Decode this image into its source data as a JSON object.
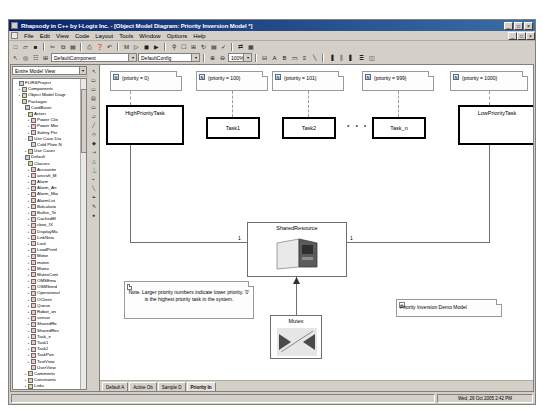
{
  "window": {
    "title": "Rhapsody in C++ by I-Logix Inc.   - [Object Model Diagram: Priority Inversion Model *]",
    "minimize_label": "_",
    "maximize_label": "□",
    "close_label": "×",
    "inner_minimize_label": "_",
    "inner_maximize_label": "□",
    "inner_close_label": "×"
  },
  "menubar": {
    "items": [
      {
        "label": "File"
      },
      {
        "label": "Edit"
      },
      {
        "label": "View"
      },
      {
        "label": "Code"
      },
      {
        "label": "Layout"
      },
      {
        "label": "Tools"
      },
      {
        "label": "Window"
      },
      {
        "label": "Options"
      },
      {
        "label": "Help"
      }
    ]
  },
  "toolbar_main": {
    "buttons": [
      {
        "icon": "new-document-icon",
        "glyph": "□"
      },
      {
        "icon": "open-folder-icon",
        "glyph": "▱"
      },
      {
        "icon": "save-icon",
        "glyph": "■"
      },
      {
        "icon": "cut-icon",
        "glyph": "✂"
      },
      {
        "icon": "copy-icon",
        "glyph": "⧉"
      },
      {
        "icon": "paste-icon",
        "glyph": "▤"
      },
      {
        "icon": "print-icon",
        "glyph": "⎙"
      },
      {
        "icon": "find-icon",
        "glyph": "⚲"
      },
      {
        "icon": "help-pointer-icon",
        "glyph": "❓"
      },
      {
        "icon": "undo-icon",
        "glyph": "↶"
      },
      {
        "icon": "generate-code-icon",
        "glyph": "M"
      },
      {
        "icon": "build-icon",
        "glyph": "▷"
      },
      {
        "icon": "stop-icon",
        "glyph": "◼"
      },
      {
        "icon": "animate-icon",
        "glyph": "▶"
      }
    ]
  },
  "toolbar_second": {
    "buttons_left": [
      {
        "icon": "select-arrow-icon",
        "glyph": "↖"
      },
      {
        "icon": "zoom-fit-icon",
        "glyph": "◎"
      },
      {
        "icon": "browser-toggle-icon",
        "glyph": "☷"
      },
      {
        "icon": "grid-icon",
        "glyph": "⊞"
      }
    ],
    "component_combo": {
      "value": "DefaultComponent",
      "arrow": "▾"
    },
    "config_combo": {
      "value": "DefaultConfig",
      "arrow": "▾"
    },
    "zoom_combo": {
      "value": "100%",
      "arrow": "▾"
    },
    "buttons_right": [
      {
        "icon": "zoom-in-icon",
        "glyph": "⊕"
      },
      {
        "icon": "zoom-out-icon",
        "glyph": "⊖"
      },
      {
        "icon": "fit-window-icon",
        "glyph": "⊟"
      },
      {
        "icon": "text-style-icon",
        "glyph": "A"
      },
      {
        "icon": "bold-icon",
        "glyph": "B"
      },
      {
        "icon": "box-icon",
        "glyph": "▭"
      },
      {
        "icon": "align-icon",
        "glyph": "≡"
      },
      {
        "icon": "line-icon",
        "glyph": "╲"
      },
      {
        "icon": "align-left-icon",
        "glyph": "▐"
      },
      {
        "icon": "align-center-icon",
        "glyph": "║"
      },
      {
        "icon": "align-right-icon",
        "glyph": "▌"
      },
      {
        "icon": "distribute-icon",
        "glyph": "≣"
      },
      {
        "icon": "layers-icon",
        "glyph": "◫"
      }
    ]
  },
  "browser": {
    "view_combo": {
      "value": "Entire Model View",
      "arrow": "▾"
    },
    "close_label": "×",
    "tree": [
      {
        "indent": 0,
        "exp": "-",
        "icon": "ic-pkg",
        "label": "FLIRSProject"
      },
      {
        "indent": 1,
        "exp": "+",
        "icon": "ic-folder",
        "label": "Components"
      },
      {
        "indent": 1,
        "exp": "+",
        "icon": "ic-diag",
        "label": "Object Model Diagr"
      },
      {
        "indent": 1,
        "exp": "-",
        "icon": "ic-folder",
        "label": "Packages"
      },
      {
        "indent": 2,
        "exp": "-",
        "icon": "ic-pkg",
        "label": "CardBasin"
      },
      {
        "indent": 3,
        "exp": "-",
        "icon": "ic-folder",
        "label": "Actors"
      },
      {
        "indent": 4,
        "exp": "+",
        "icon": "ic-class",
        "label": "Power Clie"
      },
      {
        "indent": 4,
        "exp": "+",
        "icon": "ic-class",
        "label": "Power Mor"
      },
      {
        "indent": 4,
        "exp": "+",
        "icon": "ic-class",
        "label": "Safety Per"
      },
      {
        "indent": 3,
        "exp": "-",
        "icon": "ic-diag",
        "label": "Use Case Dia"
      },
      {
        "indent": 4,
        "exp": "",
        "icon": "ic-diag",
        "label": "Cold Plate N"
      },
      {
        "indent": 3,
        "exp": "+",
        "icon": "ic-folder",
        "label": "Use Cases"
      },
      {
        "indent": 2,
        "exp": "-",
        "icon": "ic-pkg",
        "label": "Default"
      },
      {
        "indent": 3,
        "exp": "-",
        "icon": "ic-folder",
        "label": "Classes"
      },
      {
        "indent": 4,
        "exp": "+",
        "icon": "ic-class",
        "label": "Accountin"
      },
      {
        "indent": 4,
        "exp": "+",
        "icon": "ic-class",
        "label": "aircraft_M"
      },
      {
        "indent": 4,
        "exp": "+",
        "icon": "ic-class",
        "label": "Alarm"
      },
      {
        "indent": 4,
        "exp": "+",
        "icon": "ic-class",
        "label": "Alarm_Arr"
      },
      {
        "indent": 4,
        "exp": "+",
        "icon": "ic-class",
        "label": "Alarm_Mar"
      },
      {
        "indent": 4,
        "exp": "+",
        "icon": "ic-class",
        "label": "AlarmList"
      },
      {
        "indent": 4,
        "exp": "+",
        "icon": "ic-class",
        "label": "Balcalario"
      },
      {
        "indent": 4,
        "exp": "+",
        "icon": "ic-class",
        "label": "Builtin_Te"
      },
      {
        "indent": 4,
        "exp": "+",
        "icon": "ic-class",
        "label": "CachedEl"
      },
      {
        "indent": 4,
        "exp": "+",
        "icon": "ic-class",
        "label": "cbox_IX"
      },
      {
        "indent": 4,
        "exp": "+",
        "icon": "ic-class",
        "label": "DisplayMa"
      },
      {
        "indent": 4,
        "exp": "+",
        "icon": "ic-class",
        "label": "LinkNew"
      },
      {
        "indent": 4,
        "exp": "+",
        "icon": "ic-class",
        "label": "Lock"
      },
      {
        "indent": 4,
        "exp": "+",
        "icon": "ic-class",
        "label": "LoadPrintf"
      },
      {
        "indent": 4,
        "exp": "+",
        "icon": "ic-class",
        "label": "Motor"
      },
      {
        "indent": 4,
        "exp": "+",
        "icon": "ic-class",
        "label": "muton"
      },
      {
        "indent": 4,
        "exp": "+",
        "icon": "ic-class",
        "label": "Mutex"
      },
      {
        "indent": 4,
        "exp": "+",
        "icon": "ic-class",
        "label": "MutexCont"
      },
      {
        "indent": 4,
        "exp": "+",
        "icon": "ic-class",
        "label": "OMSEma"
      },
      {
        "indent": 4,
        "exp": "+",
        "icon": "ic-class",
        "label": "OSMSend"
      },
      {
        "indent": 4,
        "exp": "+",
        "icon": "ic-class",
        "label": "Operational"
      },
      {
        "indent": 4,
        "exp": "+",
        "icon": "ic-class",
        "label": "OClient"
      },
      {
        "indent": 4,
        "exp": "+",
        "icon": "ic-class",
        "label": "Queue"
      },
      {
        "indent": 4,
        "exp": "+",
        "icon": "ic-class",
        "label": "Robot_on"
      },
      {
        "indent": 4,
        "exp": "+",
        "icon": "ic-class",
        "label": "sensor"
      },
      {
        "indent": 4,
        "exp": "+",
        "icon": "ic-class",
        "label": "SharedRe"
      },
      {
        "indent": 4,
        "exp": "+",
        "icon": "ic-class",
        "label": "SharedRes"
      },
      {
        "indent": 4,
        "exp": "+",
        "icon": "ic-class",
        "label": "Task_n"
      },
      {
        "indent": 4,
        "exp": "+",
        "icon": "ic-class",
        "label": "Task1"
      },
      {
        "indent": 4,
        "exp": "+",
        "icon": "ic-class",
        "label": "Task2"
      },
      {
        "indent": 4,
        "exp": "+",
        "icon": "ic-class",
        "label": "TaskPan"
      },
      {
        "indent": 4,
        "exp": "+",
        "icon": "ic-class",
        "label": "TextView"
      },
      {
        "indent": 4,
        "exp": "",
        "icon": "ic-class",
        "label": "UserView"
      },
      {
        "indent": 3,
        "exp": "+",
        "icon": "ic-folder",
        "label": "Comments"
      },
      {
        "indent": 3,
        "exp": "+",
        "icon": "ic-folder",
        "label": "Constraints"
      },
      {
        "indent": 3,
        "exp": "+",
        "icon": "ic-folder",
        "label": "Links"
      },
      {
        "indent": 3,
        "exp": "+",
        "icon": "ic-diag",
        "label": "Object Model"
      },
      {
        "indent": 3,
        "exp": "+",
        "icon": "ic-obj",
        "label": "Objects"
      },
      {
        "indent": 2,
        "exp": "-",
        "icon": "ic-pkg",
        "label": "Telescope"
      },
      {
        "indent": 3,
        "exp": "+",
        "icon": "ic-folder",
        "label": "Constraints"
      },
      {
        "indent": 3,
        "exp": "-",
        "icon": "ic-folder",
        "label": "Deployment"
      },
      {
        "indent": 4,
        "exp": "",
        "icon": "ic-diag",
        "label": "Telescope"
      },
      {
        "indent": 3,
        "exp": "+",
        "icon": "ic-obj",
        "label": "System"
      }
    ]
  },
  "palette": {
    "tools": [
      {
        "icon": "pointer-tool-icon",
        "glyph": "↖"
      },
      {
        "icon": "class-tool-icon",
        "glyph": "▭"
      },
      {
        "icon": "object-tool-icon",
        "glyph": "▭"
      },
      {
        "icon": "package-tool-icon",
        "glyph": "▤"
      },
      {
        "icon": "actor-tool-icon",
        "glyph": "▭"
      },
      {
        "icon": "note-tool-icon",
        "glyph": "▱"
      },
      {
        "icon": "association-tool-icon",
        "glyph": "╱"
      },
      {
        "icon": "aggregation-tool-icon",
        "glyph": "◇"
      },
      {
        "icon": "composition-tool-icon",
        "glyph": "◆"
      },
      {
        "icon": "dependency-tool-icon",
        "glyph": "⇢"
      },
      {
        "icon": "generalize-tool-icon",
        "glyph": "△"
      },
      {
        "icon": "anchor-tool-icon",
        "glyph": "⚓"
      },
      {
        "icon": "port-tool-icon",
        "glyph": "▪"
      },
      {
        "icon": "link-tool-icon",
        "glyph": "╲"
      },
      {
        "icon": "text-tool-icon",
        "glyph": "✒"
      },
      {
        "icon": "freehand-tool-icon",
        "glyph": "✎"
      },
      {
        "icon": "stamp-tool-icon",
        "glyph": "●"
      }
    ]
  },
  "diagram": {
    "properties": [
      {
        "name": "priority-note-high",
        "text": "{priority = 0}",
        "icon_glyph": "N"
      },
      {
        "name": "priority-note-t1",
        "text": "{priority = 100}",
        "icon_glyph": "N"
      },
      {
        "name": "priority-note-t2",
        "text": "{priority = 101}",
        "icon_glyph": "N"
      },
      {
        "name": "priority-note-tn",
        "text": "{priority = 999}",
        "icon_glyph": "N"
      },
      {
        "name": "priority-note-low",
        "text": "{priority = 1000}",
        "icon_glyph": "N"
      }
    ],
    "classes": [
      {
        "name": "high-priority-task",
        "label": "HighPriorityTask"
      },
      {
        "name": "task1",
        "label": "Task1"
      },
      {
        "name": "task2",
        "label": "Task2"
      },
      {
        "name": "task-n",
        "label": "Task_n"
      },
      {
        "name": "low-priority-task",
        "label": "LowPriorityTask"
      }
    ],
    "ellipsis": "• • •",
    "shared_resource": {
      "label": "SharedResource"
    },
    "mutex": {
      "label": "Mutex"
    },
    "multiplicity_left": "1",
    "multiplicity_right": "1",
    "note": {
      "text": "Note. Larger priority numbers indicate lower priority. '0' is the highest priority task in the system."
    },
    "model_label": {
      "text": "Priority Inversion Demo Model",
      "icon_glyph": "□"
    }
  },
  "diagram_tabs": [
    {
      "label": "Default A",
      "active": false
    },
    {
      "label": "Active Ob",
      "active": false
    },
    {
      "label": "Sample D",
      "active": false
    },
    {
      "label": "Priority In",
      "active": true
    }
  ],
  "statusbar": {
    "message": "",
    "timestamp": "Wed, 26 Oct 2005  2:42 PM"
  }
}
